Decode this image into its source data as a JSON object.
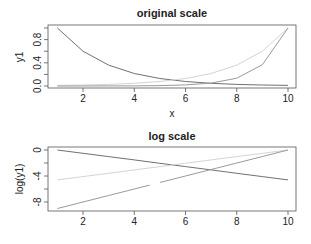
{
  "chart_data": [
    {
      "type": "line",
      "title": "original scale",
      "xlabel": "x",
      "ylabel": "y1",
      "x": [
        1,
        2,
        3,
        4,
        5,
        6,
        7,
        8,
        9,
        10
      ],
      "xlim": [
        1,
        10
      ],
      "ylim": [
        0,
        1
      ],
      "xticks": [
        2,
        4,
        6,
        8,
        10
      ],
      "yticks": [
        0.0,
        0.2,
        0.4,
        0.6,
        0.8,
        1.0
      ],
      "ytick_labels": [
        "0.0",
        "0.4",
        "0.8"
      ],
      "ytick_label_values": [
        0.0,
        0.4,
        0.8
      ],
      "grid": false,
      "series": [
        {
          "name": "decreasing",
          "color": "#707070",
          "values": [
            1.0,
            0.6,
            0.36,
            0.216,
            0.1296,
            0.0778,
            0.0467,
            0.028,
            0.0168,
            0.0101
          ]
        },
        {
          "name": "increasing",
          "color": "#d4d4d4",
          "values": [
            0.0101,
            0.0168,
            0.028,
            0.0467,
            0.0778,
            0.1296,
            0.216,
            0.36,
            0.6,
            1.0
          ]
        },
        {
          "name": "exponential",
          "color": "#9a9a9a",
          "values": [
            0.0001,
            0.0003,
            0.0009,
            0.0025,
            0.0067,
            0.0183,
            0.0498,
            0.1353,
            0.3679,
            1.0
          ]
        }
      ]
    },
    {
      "type": "line",
      "title": "log scale",
      "xlabel": "",
      "ylabel": "log(y1)",
      "x": [
        1,
        2,
        3,
        4,
        5,
        6,
        7,
        8,
        9,
        10
      ],
      "xlim": [
        1,
        10
      ],
      "ylim": [
        -9,
        0
      ],
      "xticks": [
        2,
        4,
        6,
        8,
        10
      ],
      "yticks": [
        0,
        -2,
        -4,
        -6,
        -8
      ],
      "ytick_labels": [
        "0",
        "-4",
        "-8"
      ],
      "ytick_label_values": [
        0,
        -4,
        -8
      ],
      "grid": false,
      "series": [
        {
          "name": "decreasing",
          "color": "#707070",
          "values": [
            0,
            -0.51,
            -1.02,
            -1.53,
            -2.04,
            -2.55,
            -3.06,
            -3.58,
            -4.09,
            -4.6
          ]
        },
        {
          "name": "increasing",
          "color": "#d4d4d4",
          "values": [
            -4.6,
            -4.09,
            -3.58,
            -3.06,
            -2.55,
            -2.04,
            -1.53,
            -1.02,
            -0.51,
            0
          ]
        },
        {
          "name": "exponential",
          "color": "#9a9a9a",
          "values": [
            -9,
            -8,
            -7,
            -6,
            -5,
            -4,
            -3,
            -2,
            -1,
            0
          ],
          "gap_between": [
            4.6,
            5.0
          ]
        }
      ]
    }
  ],
  "panels": [
    {
      "title": "original scale",
      "xlabel": "x",
      "ylabel": "y1"
    },
    {
      "title": "log scale",
      "xlabel": "",
      "ylabel": "log(y1)"
    }
  ],
  "colors": {
    "frame": "#555555",
    "text": "#222222",
    "background": "#ffffff"
  }
}
